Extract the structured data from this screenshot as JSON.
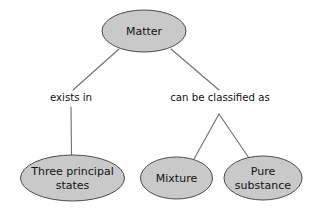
{
  "diagram": {
    "title_node": "Matter",
    "type": "concept-map",
    "background_color": "#ffffff",
    "node_fill_color": "#c9c9c9",
    "node_border_color": "#4a4a4a",
    "edge_color": "#6e6e6e",
    "text_color": "#111111",
    "nodes": [
      {
        "id": "matter",
        "label": "Matter",
        "lines": [
          "Matter"
        ],
        "cx": 144,
        "cy": 31,
        "rx": 42,
        "ry": 21
      },
      {
        "id": "three-states",
        "label": "Three principal states",
        "lines": [
          "Three principal",
          "states"
        ],
        "cx": 72.5,
        "cy": 178,
        "rx": 52,
        "ry": 23
      },
      {
        "id": "mixture",
        "label": "Mixture",
        "lines": [
          "Mixture"
        ],
        "cx": 176.5,
        "cy": 178,
        "rx": 36,
        "ry": 21
      },
      {
        "id": "pure-substance",
        "label": "Pure substance",
        "lines": [
          "Pure",
          "substance"
        ],
        "cx": 263,
        "cy": 178,
        "rx": 39,
        "ry": 22
      }
    ],
    "edge_labels": [
      {
        "id": "exists-in",
        "text": "exists in",
        "x": 71,
        "y": 98
      },
      {
        "id": "can-be-classified-as",
        "text": "can be classified as",
        "x": 220,
        "y": 98
      }
    ],
    "edges": [
      {
        "id": "matter-to-exists-in",
        "from": "matter",
        "to": "exists-in",
        "x1": 119,
        "y1": 49,
        "x2": 73,
        "y2": 90
      },
      {
        "id": "matter-to-classified-as",
        "from": "matter",
        "to": "can-be-classified-as",
        "x1": 171,
        "y1": 49,
        "x2": 219,
        "y2": 90
      },
      {
        "id": "exists-in-to-three-states",
        "from": "exists-in",
        "to": "three-states",
        "x1": 71,
        "y1": 107,
        "x2": 71.5,
        "y2": 157
      },
      {
        "id": "classified-to-mixture",
        "from": "can-be-classified-as",
        "to": "mixture",
        "x1": 219,
        "y1": 114,
        "x2": 194,
        "y2": 159
      },
      {
        "id": "classified-to-pure-substance",
        "from": "can-be-classified-as",
        "to": "pure-substance",
        "x1": 219,
        "y1": 114,
        "x2": 249,
        "y2": 158
      }
    ]
  }
}
